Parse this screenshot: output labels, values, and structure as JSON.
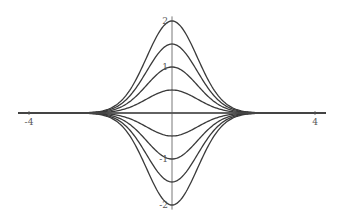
{
  "chart_data": {
    "type": "line",
    "title": "",
    "xlabel": "",
    "ylabel": "",
    "xlim": [
      -4.3,
      4.3
    ],
    "ylim": [
      -2.1,
      2.1
    ],
    "grid": false,
    "legend": "none",
    "x_ticks": [
      {
        "value": -4,
        "label": "-4"
      },
      {
        "value": 4,
        "label": "4"
      }
    ],
    "y_ticks": [
      {
        "value": 2,
        "label": "2"
      },
      {
        "value": 1,
        "label": "1"
      },
      {
        "value": -1,
        "label": "-1"
      },
      {
        "value": -2,
        "label": "-2"
      }
    ],
    "function": "a * exp(-x^2)",
    "series": [
      {
        "name": "a=2",
        "amplitude": 2
      },
      {
        "name": "a=1.5",
        "amplitude": 1.5
      },
      {
        "name": "a=1",
        "amplitude": 1
      },
      {
        "name": "a=0.5",
        "amplitude": 0.5
      },
      {
        "name": "a=0",
        "amplitude": 0
      },
      {
        "name": "a=-0.5",
        "amplitude": -0.5
      },
      {
        "name": "a=-1",
        "amplitude": -1
      },
      {
        "name": "a=-1.5",
        "amplitude": -1.5
      },
      {
        "name": "a=-2",
        "amplitude": -2
      }
    ],
    "color": "#3a3a3a"
  }
}
